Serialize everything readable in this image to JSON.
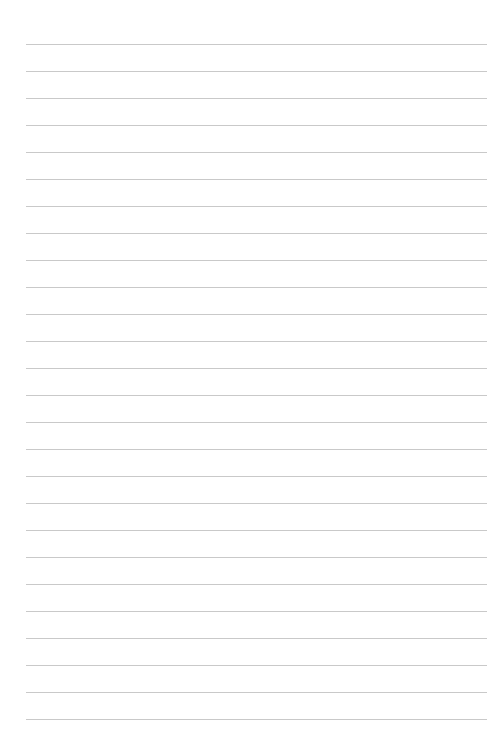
{
  "page": {
    "type": "lined-paper",
    "background_color": "#ffffff",
    "line_color": "#c9c9c9",
    "line_count": 26,
    "first_line_y": 44,
    "line_spacing": 27,
    "line_left": 26,
    "line_right": 487
  }
}
